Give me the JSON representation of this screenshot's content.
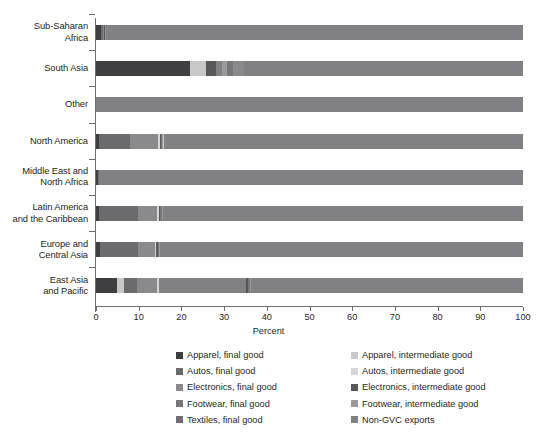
{
  "chart_data": {
    "type": "bar",
    "orientation": "horizontal",
    "stacked": true,
    "title": "",
    "xlabel": "Percent",
    "ylabel": "",
    "xlim": [
      0,
      100
    ],
    "xticks": [
      0,
      10,
      20,
      30,
      40,
      50,
      60,
      70,
      80,
      90,
      100
    ],
    "xtick_labels": [
      "0",
      "10",
      "20",
      "30",
      "40",
      "50",
      "60",
      "70",
      "80",
      "90",
      "100"
    ],
    "grid": false,
    "legend_position": "bottom",
    "categories": [
      "Sub-Saharan\nAfrica",
      "South Asia",
      "Other",
      "North America",
      "Middle East and\nNorth Africa",
      "Latin America\nand the Caribbean",
      "Europe and\nCentral Asia",
      "East Asia\nand Pacific"
    ],
    "series": [
      {
        "name": "Apparel, final good",
        "color": "#3f3f41",
        "values": [
          1.1,
          22.0,
          0.0,
          0.6,
          0.4,
          0.7,
          0.9,
          5.0
        ]
      },
      {
        "name": "Apparel, intermediate good",
        "color": "#c8c8c8",
        "values": [
          0.0,
          3.8,
          0.0,
          0.3,
          0.2,
          0.3,
          0.4,
          1.6
        ]
      },
      {
        "name": "Autos, final good",
        "color": "#6b6b6d",
        "values": [
          0.5,
          0.0,
          0.0,
          7.4,
          0.2,
          9.1,
          9.0,
          2.9
        ]
      },
      {
        "name": "Autos, intermediate good",
        "color": "#d6d6d6",
        "values": [
          0.0,
          0.0,
          0.0,
          0.3,
          0.0,
          0.3,
          0.2,
          0.4
        ]
      },
      {
        "name": "Electronics, final good",
        "color": "#8a8a8c",
        "values": [
          0.3,
          2.5,
          0.0,
          6.6,
          0.2,
          4.6,
          4.0,
          4.8
        ]
      },
      {
        "name": "Electronics, intermediate good",
        "color": "#58585a",
        "values": [
          0.2,
          2.3,
          0.0,
          0.4,
          0.2,
          0.4,
          0.4,
          0.5
        ]
      },
      {
        "name": "Footwear, final good",
        "color": "#77777a",
        "values": [
          0.1,
          1.6,
          0.0,
          0.2,
          0.1,
          0.3,
          0.2,
          0.4
        ]
      },
      {
        "name": "Footwear, intermediate good",
        "color": "#9a9a9c",
        "values": [
          0.1,
          1.0,
          0.0,
          0.2,
          0.1,
          0.2,
          0.2,
          0.3
        ]
      },
      {
        "name": "Non-GVC exports",
        "color": "#818184",
        "values": [
          97.7,
          66.8,
          100.0,
          84.0,
          98.6,
          84.1,
          84.7,
          84.1
        ]
      }
    ],
    "bar_patterns": [
      {
        "category": "Sub-Saharan Africa",
        "segments": [
          {
            "series": "Apparel, final good",
            "value": 1.1
          },
          {
            "series": "Autos, final good",
            "value": 0.5
          },
          {
            "series": "Electronics, final good",
            "value": 0.3
          },
          {
            "series": "Electronics, intermediate good",
            "value": 0.2
          },
          {
            "series": "Footwear, final good",
            "value": 0.1
          },
          {
            "series": "Footwear, intermediate good",
            "value": 0.1
          },
          {
            "series": "Non-GVC exports",
            "value": 97.7
          }
        ]
      },
      {
        "category": "South Asia",
        "segments": [
          {
            "series": "Apparel, final good",
            "value": 22.0
          },
          {
            "series": "Apparel, intermediate good",
            "value": 3.8
          },
          {
            "series": "Electronics, intermediate good",
            "value": 2.3
          },
          {
            "series": "Non-GVC exports",
            "value": 1.5
          },
          {
            "series": "Footwear, intermediate good",
            "value": 1.0
          },
          {
            "series": "Footwear, final good",
            "value": 1.6
          },
          {
            "series": "Electronics, final good",
            "value": 2.5
          },
          {
            "series": "Non-GVC exports",
            "value": 65.3
          }
        ]
      },
      {
        "category": "Other",
        "segments": [
          {
            "series": "Non-GVC exports",
            "value": 100.0
          }
        ]
      },
      {
        "category": "North America",
        "segments": [
          {
            "series": "Apparel, final good",
            "value": 0.6
          },
          {
            "series": "Autos, final good",
            "value": 7.4
          },
          {
            "series": "Electronics, final good",
            "value": 6.6
          },
          {
            "series": "Autos, intermediate good",
            "value": 0.3
          },
          {
            "series": "Electronics, intermediate good",
            "value": 0.4
          },
          {
            "series": "Footwear, final good",
            "value": 0.2
          },
          {
            "series": "Footwear, intermediate good",
            "value": 0.2
          },
          {
            "series": "Apparel, intermediate good",
            "value": 0.3
          },
          {
            "series": "Non-GVC exports",
            "value": 84.0
          }
        ]
      },
      {
        "category": "Middle East and North Africa",
        "segments": [
          {
            "series": "Apparel, final good",
            "value": 0.4
          },
          {
            "series": "Autos, final good",
            "value": 0.2
          },
          {
            "series": "Electronics, final good",
            "value": 0.2
          },
          {
            "series": "Non-GVC exports",
            "value": 99.2
          }
        ]
      },
      {
        "category": "Latin America and the Caribbean",
        "segments": [
          {
            "series": "Apparel, final good",
            "value": 0.7
          },
          {
            "series": "Autos, final good",
            "value": 9.1
          },
          {
            "series": "Electronics, final good",
            "value": 4.6
          },
          {
            "series": "Autos, intermediate good",
            "value": 0.3
          },
          {
            "series": "Electronics, intermediate good",
            "value": 0.4
          },
          {
            "series": "Footwear, final good",
            "value": 0.3
          },
          {
            "series": "Footwear, intermediate good",
            "value": 0.2
          },
          {
            "series": "Non-GVC exports",
            "value": 6.3
          },
          {
            "series": "Non-GVC exports",
            "value": 78.1
          }
        ]
      },
      {
        "category": "Europe and Central Asia",
        "segments": [
          {
            "series": "Apparel, final good",
            "value": 0.9
          },
          {
            "series": "Autos, final good",
            "value": 9.0
          },
          {
            "series": "Electronics, final good",
            "value": 4.0
          },
          {
            "series": "Autos, intermediate good",
            "value": 0.2
          },
          {
            "series": "Electronics, intermediate good",
            "value": 0.4
          },
          {
            "series": "Footwear, final good",
            "value": 0.2
          },
          {
            "series": "Footwear, intermediate good",
            "value": 0.2
          },
          {
            "series": "Non-GVC exports",
            "value": 6.4
          },
          {
            "series": "Non-GVC exports",
            "value": 78.7
          }
        ]
      },
      {
        "category": "East Asia and Pacific",
        "segments": [
          {
            "series": "Apparel, final good",
            "value": 5.0
          },
          {
            "series": "Apparel, intermediate good",
            "value": 1.6
          },
          {
            "series": "Autos, final good",
            "value": 2.9
          },
          {
            "series": "Electronics, final good",
            "value": 4.8
          },
          {
            "series": "Autos, intermediate good",
            "value": 0.4
          },
          {
            "series": "Non-GVC exports",
            "value": 20.4
          },
          {
            "series": "Electronics, intermediate good",
            "value": 0.5
          },
          {
            "series": "Footwear, final good",
            "value": 0.4
          },
          {
            "series": "Footwear, intermediate good",
            "value": 0.3
          },
          {
            "series": "Non-GVC exports",
            "value": 63.7
          }
        ]
      }
    ]
  },
  "legend": {
    "items": [
      {
        "label": "Apparel, final good",
        "color": "#3f3f41"
      },
      {
        "label": "Apparel, intermediate good",
        "color": "#c8c8c8"
      },
      {
        "label": "Autos, final good",
        "color": "#6b6b6d"
      },
      {
        "label": "Autos, intermediate good",
        "color": "#d6d6d6"
      },
      {
        "label": "Electronics, final good",
        "color": "#8a8a8c"
      },
      {
        "label": "Electronics, intermediate good",
        "color": "#58585a"
      },
      {
        "label": "Footwear, final good",
        "color": "#77777a"
      },
      {
        "label": "Footwear, intermediate good",
        "color": "#9a9a9c"
      },
      {
        "label": "Textiles, final good",
        "color": "#6f6f72"
      },
      {
        "label": "Non-GVC exports",
        "color": "#818184"
      }
    ]
  },
  "colors": {
    "axis": "#6d6e71",
    "text": "#231f20",
    "background": "#ffffff"
  }
}
